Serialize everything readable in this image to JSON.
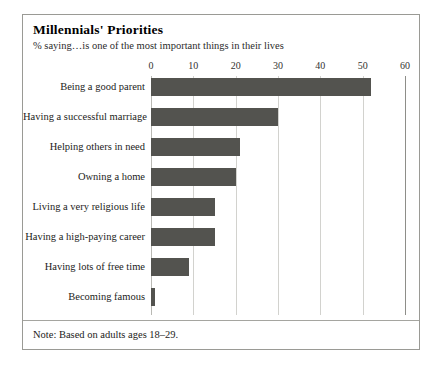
{
  "chart_data": {
    "type": "bar",
    "orientation": "horizontal",
    "title": "Millennials' Priorities",
    "subtitle": "% saying…is one of the most important things in their lives",
    "note": "Note: Based on adults ages 18–29.",
    "xlabel": "",
    "ylabel": "",
    "xlim": [
      0,
      60
    ],
    "xticks": [
      0,
      10,
      20,
      30,
      40,
      50,
      60
    ],
    "xtick_labels": [
      "0",
      "10",
      "20",
      "30",
      "40",
      "50",
      "60"
    ],
    "grid": true,
    "legend": "none",
    "bar_color": "#53534f",
    "categories": [
      "Being a good parent",
      "Having a successful marriage",
      "Helping others in need",
      "Owning a home",
      "Living a very religious life",
      "Having a high-paying career",
      "Having lots of free time",
      "Becoming famous"
    ],
    "values": [
      52,
      30,
      21,
      20,
      15,
      15,
      9,
      1
    ]
  }
}
